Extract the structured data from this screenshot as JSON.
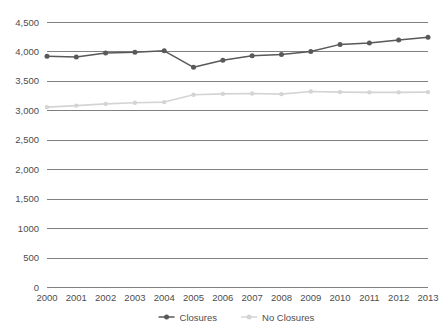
{
  "chart_data": {
    "type": "line",
    "title": "",
    "subtitle": "",
    "xlabel": "",
    "ylabel": "",
    "categories": [
      "2000",
      "2001",
      "2002",
      "2003",
      "2004",
      "2005",
      "2006",
      "2007",
      "2008",
      "2009",
      "2010",
      "2011",
      "2012",
      "2013"
    ],
    "ylim": [
      0,
      4500
    ],
    "ytick_labels": [
      "4,500",
      "4,000",
      "3,500",
      "3,000",
      "2,500",
      "2,000",
      "1,500",
      "1000",
      "500",
      "0"
    ],
    "ytick_values": [
      4500,
      4000,
      3500,
      3000,
      2500,
      2000,
      1500,
      1000,
      500,
      0
    ],
    "grid": "horizontal",
    "legend_position": "bottom-center",
    "series": [
      {
        "name": "Closures",
        "color": "#595959",
        "marker": "circle",
        "values": [
          3920,
          3905,
          3975,
          3985,
          4010,
          3730,
          3850,
          3925,
          3950,
          4000,
          4120,
          4145,
          4195,
          4240
        ]
      },
      {
        "name": "No Closures",
        "color": "#d4d4d4",
        "marker": "circle",
        "values": [
          3055,
          3080,
          3110,
          3130,
          3140,
          3265,
          3280,
          3285,
          3275,
          3320,
          3310,
          3305,
          3305,
          3310
        ]
      }
    ]
  },
  "legend": {
    "items": [
      {
        "label": "Closures",
        "color": "#595959"
      },
      {
        "label": "No Closures",
        "color": "#d4d4d4"
      }
    ]
  }
}
